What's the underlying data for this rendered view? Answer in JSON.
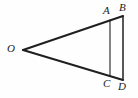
{
  "figure": {
    "kind": "geometry-diagram",
    "background_color": "#fefefe",
    "stroke_color": "#1f1f1f",
    "label_color": "#1c1c1c",
    "width": 138,
    "height": 98,
    "points": [
      {
        "id": "O",
        "label": "O",
        "x": 23,
        "y": 50,
        "label_x": 7,
        "label_y": 43
      },
      {
        "id": "A",
        "label": "A",
        "x": 110,
        "y": 20,
        "label_x": 103,
        "label_y": 5
      },
      {
        "id": "B",
        "label": "B",
        "x": 123,
        "y": 16,
        "label_x": 119,
        "label_y": 2
      },
      {
        "id": "C",
        "label": "C",
        "x": 110,
        "y": 76,
        "label_x": 103,
        "label_y": 78
      },
      {
        "id": "D",
        "label": "D",
        "x": 123,
        "y": 80,
        "label_x": 118,
        "label_y": 81
      }
    ],
    "segments": [
      {
        "id": "OB",
        "from": "O",
        "to": "B",
        "style": "solid",
        "width": 2.0
      },
      {
        "id": "OD",
        "from": "O",
        "to": "D",
        "style": "solid",
        "width": 2.0
      },
      {
        "id": "AC",
        "from": "A",
        "to": "C",
        "style": "solid",
        "width": 1.1
      },
      {
        "id": "BD",
        "from": "B",
        "to": "D",
        "style": "solid",
        "width": 1.5
      }
    ]
  }
}
